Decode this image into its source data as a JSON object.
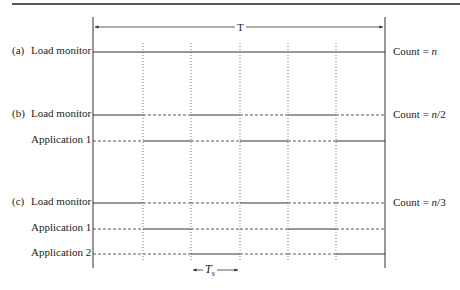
{
  "diagram": {
    "period_label": "T",
    "slot_label": "T",
    "slot_label_sub": "s",
    "colors": {
      "line": "#333333",
      "dotted": "#555555",
      "rule": "#222222"
    },
    "geometry": {
      "left_x": 93,
      "right_x": 385,
      "slot_x": [
        93,
        143,
        191,
        240,
        288,
        336,
        385
      ]
    },
    "panels": [
      {
        "tag": "(a)",
        "count_prefix": "Count = ",
        "count_value": "n",
        "count_suffix": "",
        "rows": [
          {
            "label": "Load monitor",
            "y": 52,
            "pattern": [
              "solid",
              "solid",
              "solid",
              "solid",
              "solid",
              "solid"
            ]
          }
        ]
      },
      {
        "tag": "(b)",
        "count_prefix": "Count = ",
        "count_value": "n",
        "count_suffix": "/2",
        "rows": [
          {
            "label": "Load monitor",
            "y": 115,
            "pattern": [
              "solid",
              "dashed",
              "solid",
              "dashed",
              "solid",
              "dashed"
            ]
          },
          {
            "label": "Application 1",
            "y": 141,
            "pattern": [
              "dashed",
              "solid",
              "dashed",
              "solid",
              "dashed",
              "solid"
            ]
          }
        ]
      },
      {
        "tag": "(c)",
        "count_prefix": "Count = ",
        "count_value": "n",
        "count_suffix": "/3",
        "rows": [
          {
            "label": "Load monitor",
            "y": 203,
            "pattern": [
              "solid",
              "dashed",
              "dashed",
              "solid",
              "dashed",
              "dashed"
            ]
          },
          {
            "label": "Application 1",
            "y": 229,
            "pattern": [
              "dashed",
              "solid",
              "dashed",
              "dashed",
              "solid",
              "dashed"
            ]
          },
          {
            "label": "Application 2",
            "y": 254,
            "pattern": [
              "dashed",
              "dashed",
              "solid",
              "dashed",
              "dashed",
              "solid"
            ]
          }
        ]
      }
    ]
  }
}
